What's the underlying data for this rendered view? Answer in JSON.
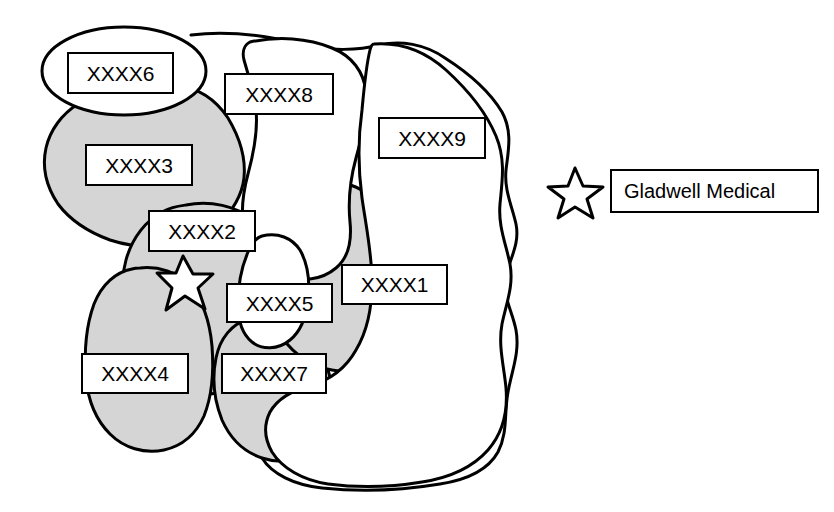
{
  "figure": {
    "type": "territory-map",
    "background_color": "#ffffff",
    "line_color": "#000000",
    "shaded_region_fill": "#d5d5d5",
    "unshaded_region_fill": "#ffffff"
  },
  "regions": [
    {
      "id": "r1",
      "label": "XXXX1",
      "shaded": false,
      "label_box": {
        "x": 341,
        "y": 264,
        "w": 107,
        "h": 41
      }
    },
    {
      "id": "r2",
      "label": "XXXX2",
      "shaded": true,
      "label_box": {
        "x": 148,
        "y": 210,
        "w": 108,
        "h": 42
      }
    },
    {
      "id": "r3",
      "label": "XXXX3",
      "shaded": true,
      "label_box": {
        "x": 85,
        "y": 144,
        "w": 108,
        "h": 42
      }
    },
    {
      "id": "r4",
      "label": "XXXX4",
      "shaded": true,
      "label_box": {
        "x": 81,
        "y": 353,
        "w": 108,
        "h": 41
      }
    },
    {
      "id": "r5",
      "label": "XXXX5",
      "shaded": false,
      "label_box": {
        "x": 226,
        "y": 283,
        "w": 107,
        "h": 40
      }
    },
    {
      "id": "r6",
      "label": "XXXX6",
      "shaded": false,
      "label_box": {
        "x": 67,
        "y": 52,
        "w": 107,
        "h": 42
      }
    },
    {
      "id": "r7",
      "label": "XXXX7",
      "shaded": true,
      "label_box": {
        "x": 221,
        "y": 353,
        "w": 106,
        "h": 41
      }
    },
    {
      "id": "r8",
      "label": "XXXX8",
      "shaded": false,
      "label_box": {
        "x": 224,
        "y": 73,
        "w": 110,
        "h": 42
      }
    },
    {
      "id": "r9",
      "label": "XXXX9",
      "shaded": false,
      "label_box": {
        "x": 378,
        "y": 117,
        "w": 108,
        "h": 42
      }
    }
  ],
  "map_marker": {
    "name": "gladwell-medical-location-star",
    "x": 182,
    "y": 277
  },
  "legend": {
    "marker_icon": "star-icon",
    "marker_box": {
      "x": 553,
      "y": 166,
      "w": 44,
      "h": 46
    },
    "entry_label": "Gladwell Medical",
    "entry_box": {
      "x": 610,
      "y": 169,
      "w": 209,
      "h": 44
    }
  }
}
